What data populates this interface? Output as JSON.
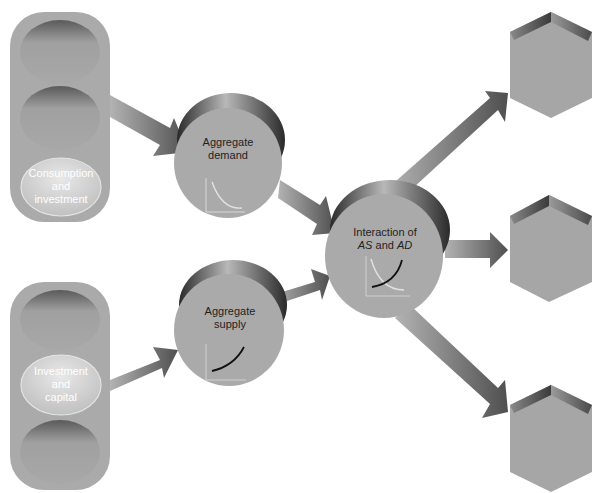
{
  "diagram": {
    "left_panels": [
      {
        "id": "top-panel",
        "slots": [
          {
            "label": ""
          },
          {
            "label": ""
          },
          {
            "label_lines": [
              "Consumption",
              "and",
              "investment"
            ],
            "highlighted": true
          }
        ]
      },
      {
        "id": "bottom-panel",
        "slots": [
          {
            "label": ""
          },
          {
            "label_lines": [
              "Investment",
              "and",
              "capital"
            ],
            "highlighted": true
          },
          {
            "label": ""
          }
        ]
      }
    ],
    "nodes": {
      "aggregate_demand": {
        "line1": "Aggregate",
        "line2": "demand",
        "curve": "downward-sloping"
      },
      "aggregate_supply": {
        "line1": "Aggregate",
        "line2": "supply",
        "curve": "upward-sloping"
      },
      "interaction": {
        "line1": "Interaction of",
        "line2_a": "AS",
        "line2_and": " and ",
        "line2_b": "AD",
        "curve": "intersecting"
      }
    },
    "outputs": [
      {
        "id": "output-top",
        "label": ""
      },
      {
        "id": "output-middle",
        "label": ""
      },
      {
        "id": "output-bottom",
        "label": ""
      }
    ],
    "arrows": [
      {
        "from": "top-panel",
        "to": "aggregate_demand"
      },
      {
        "from": "bottom-panel",
        "to": "aggregate_supply"
      },
      {
        "from": "aggregate_demand",
        "to": "interaction"
      },
      {
        "from": "aggregate_supply",
        "to": "interaction"
      },
      {
        "from": "interaction",
        "to": "output-top"
      },
      {
        "from": "interaction",
        "to": "output-middle"
      },
      {
        "from": "interaction",
        "to": "output-bottom"
      }
    ],
    "colors": {
      "panel": "#a9a9a9",
      "slot": "#a3a3a3",
      "slot_highlight": "#d6d6d6",
      "node": "#ababab",
      "node_rim": "#3c3c3c",
      "arrow_light": "#a8a8a8",
      "arrow_dark": "#555555",
      "hex_face": "#a5a5a5",
      "hex_top": "#4a4a4a"
    }
  }
}
